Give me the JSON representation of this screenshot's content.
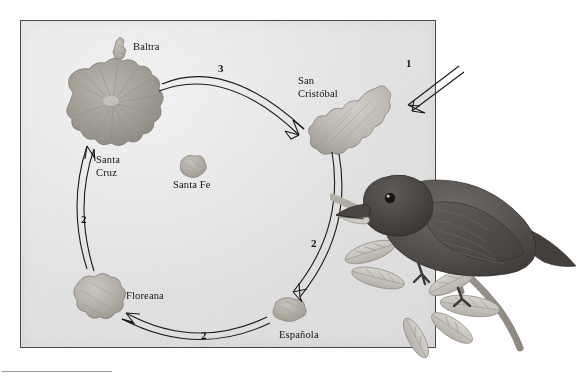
{
  "figure": {
    "kind": "galapagos-finch-colonization-map"
  },
  "islands": [
    {
      "id": "baltra",
      "label": "Baltra"
    },
    {
      "id": "santa-cruz",
      "label": "Santa\nCruz"
    },
    {
      "id": "santa-fe",
      "label": "Santa Fe"
    },
    {
      "id": "san-cristobal",
      "label": "San\nCristóbal"
    },
    {
      "id": "floreana",
      "label": "Floreana"
    },
    {
      "id": "espanola",
      "label": "Española"
    }
  ],
  "steps": [
    {
      "id": "step-1",
      "label": "1"
    },
    {
      "id": "step-3",
      "label": "3"
    },
    {
      "id": "step-2-right",
      "label": "2"
    },
    {
      "id": "step-2-bottom",
      "label": "2"
    },
    {
      "id": "step-2-left",
      "label": "2"
    }
  ],
  "colors": {
    "map_background": "#e5e5e5",
    "map_border": "#4a4a4a",
    "arrow_stroke": "#1a1a1a",
    "island_fill": "#a6a29b",
    "island_fill_light": "#c8c4bd",
    "bird_body": "#595551",
    "text": "#16130f"
  }
}
